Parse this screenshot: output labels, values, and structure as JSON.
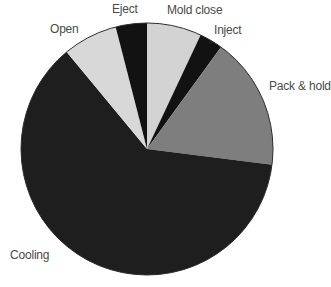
{
  "chart_data": {
    "type": "pie",
    "title": "",
    "unit": "percent",
    "start_angle_deg": 0,
    "direction": "clockwise-from-top",
    "legend": "none",
    "labels_position": "outside",
    "background_color": "#ffffff",
    "outline_color": "#2e2e2e",
    "label_text_color": "#4a4a4a",
    "segments": [
      {
        "label": "Mold close",
        "value": 7,
        "color": "#d3d3d3"
      },
      {
        "label": "Inject",
        "value": 3,
        "color": "#121212"
      },
      {
        "label": "Pack & hold",
        "value": 17,
        "color": "#7e7e7e"
      },
      {
        "label": "Cooling",
        "value": 62,
        "color": "#1e1e1e"
      },
      {
        "label": "Open",
        "value": 7,
        "color": "#d8d8d8"
      },
      {
        "label": "Eject",
        "value": 4,
        "color": "#121212"
      }
    ]
  }
}
